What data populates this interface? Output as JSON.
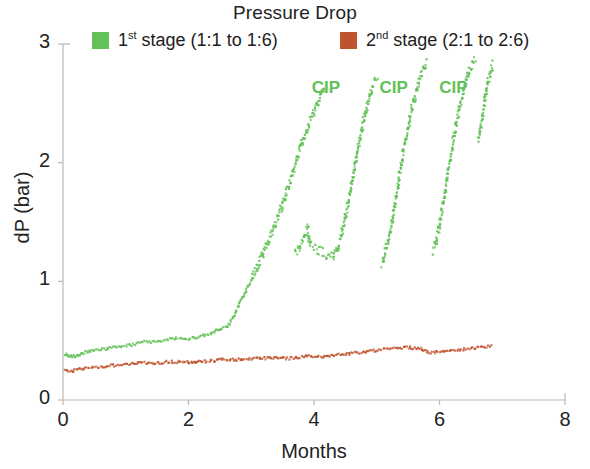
{
  "chart_data": {
    "type": "scatter",
    "title": "Pressure Drop",
    "xlabel": "Months",
    "ylabel": "dP (bar)",
    "xlim": [
      0,
      8
    ],
    "ylim": [
      0,
      3
    ],
    "xticks": [
      0,
      2,
      4,
      6,
      8
    ],
    "yticks": [
      0,
      1,
      2,
      3
    ],
    "xtick_labels": [
      "0",
      "2",
      "4",
      "6",
      "8"
    ],
    "ytick_labels": [
      "0",
      "1",
      "2",
      "3"
    ],
    "grid": false,
    "legend_position": "top",
    "colors": {
      "stage1": "#63c157",
      "stage2": "#c0522d",
      "axis": "#b8b8b8",
      "text": "#232323"
    },
    "annotations": [
      {
        "text": "CIP",
        "x": 4.22,
        "y": 2.62
      },
      {
        "text": "CIP",
        "x": 5.3,
        "y": 2.62
      },
      {
        "text": "CIP",
        "x": 6.25,
        "y": 2.62
      }
    ],
    "series": [
      {
        "name": "1st stage (1:1 to 1:6)",
        "name_parts": {
          "ordinal": "1",
          "sup": "st",
          "rest": " stage (1:1 to 1:6)"
        },
        "color": "#63c157",
        "marker": "square",
        "points": [
          [
            0.03,
            0.385
          ],
          [
            0.06,
            0.378
          ],
          [
            0.09,
            0.372
          ],
          [
            0.12,
            0.368
          ],
          [
            0.15,
            0.366
          ],
          [
            0.18,
            0.368
          ],
          [
            0.21,
            0.373
          ],
          [
            0.24,
            0.379
          ],
          [
            0.27,
            0.386
          ],
          [
            0.3,
            0.392
          ],
          [
            0.34,
            0.399
          ],
          [
            0.38,
            0.404
          ],
          [
            0.42,
            0.409
          ],
          [
            0.46,
            0.413
          ],
          [
            0.5,
            0.417
          ],
          [
            0.55,
            0.421
          ],
          [
            0.6,
            0.424
          ],
          [
            0.65,
            0.428
          ],
          [
            0.7,
            0.432
          ],
          [
            0.75,
            0.436
          ],
          [
            0.8,
            0.44
          ],
          [
            0.85,
            0.443
          ],
          [
            0.9,
            0.447
          ],
          [
            0.95,
            0.451
          ],
          [
            1.0,
            0.455
          ],
          [
            1.05,
            0.46
          ],
          [
            1.1,
            0.466
          ],
          [
            1.15,
            0.472
          ],
          [
            1.2,
            0.478
          ],
          [
            1.25,
            0.484
          ],
          [
            1.3,
            0.488
          ],
          [
            1.35,
            0.49
          ],
          [
            1.4,
            0.489
          ],
          [
            1.45,
            0.487
          ],
          [
            1.5,
            0.488
          ],
          [
            1.55,
            0.493
          ],
          [
            1.6,
            0.5
          ],
          [
            1.65,
            0.508
          ],
          [
            1.7,
            0.515
          ],
          [
            1.75,
            0.52
          ],
          [
            1.8,
            0.521
          ],
          [
            1.85,
            0.518
          ],
          [
            1.9,
            0.513
          ],
          [
            1.95,
            0.509
          ],
          [
            2.1,
            0.527
          ],
          [
            2.15,
            0.533
          ],
          [
            2.2,
            0.539
          ],
          [
            2.25,
            0.545
          ],
          [
            2.3,
            0.552
          ],
          [
            2.35,
            0.56
          ],
          [
            2.4,
            0.572
          ],
          [
            2.45,
            0.586
          ],
          [
            2.5,
            0.6
          ],
          [
            2.62,
            0.615
          ],
          [
            2.66,
            0.645
          ],
          [
            2.7,
            0.685
          ],
          [
            2.74,
            0.728
          ],
          [
            2.78,
            0.772
          ],
          [
            2.82,
            0.818
          ],
          [
            2.86,
            0.862
          ],
          [
            2.9,
            0.905
          ],
          [
            2.94,
            0.948
          ],
          [
            2.98,
            0.992
          ],
          [
            3.02,
            1.038
          ],
          [
            3.06,
            1.085
          ],
          [
            3.1,
            1.132
          ],
          [
            3.14,
            1.18
          ],
          [
            3.18,
            1.228
          ],
          [
            3.22,
            1.276
          ],
          [
            3.26,
            1.325
          ],
          [
            3.3,
            1.375
          ],
          [
            3.34,
            1.428
          ],
          [
            3.38,
            1.482
          ],
          [
            3.42,
            1.538
          ],
          [
            3.46,
            1.595
          ],
          [
            3.5,
            1.655
          ],
          [
            3.54,
            1.718
          ],
          [
            3.58,
            1.782
          ],
          [
            3.62,
            1.848
          ],
          [
            3.66,
            1.915
          ],
          [
            3.7,
            1.982
          ],
          [
            3.74,
            2.048
          ],
          [
            3.78,
            2.112
          ],
          [
            3.82,
            2.175
          ],
          [
            3.86,
            2.235
          ],
          [
            3.9,
            2.292
          ],
          [
            3.94,
            2.348
          ],
          [
            3.98,
            2.402
          ],
          [
            4.02,
            2.455
          ],
          [
            4.06,
            2.508
          ],
          [
            4.1,
            2.56
          ],
          [
            4.14,
            2.61
          ],
          [
            4.18,
            2.655
          ],
          [
            3.7,
            1.25
          ],
          [
            3.74,
            1.27
          ],
          [
            3.78,
            1.3
          ],
          [
            3.82,
            1.34
          ],
          [
            3.86,
            1.39
          ],
          [
            3.9,
            1.445
          ],
          [
            3.94,
            1.3
          ],
          [
            4.3,
            1.2
          ],
          [
            4.34,
            1.235
          ],
          [
            4.38,
            1.29
          ],
          [
            4.42,
            1.36
          ],
          [
            4.46,
            1.445
          ],
          [
            4.5,
            1.54
          ],
          [
            4.54,
            1.645
          ],
          [
            4.58,
            1.755
          ],
          [
            4.62,
            1.87
          ],
          [
            4.66,
            1.99
          ],
          [
            4.7,
            2.11
          ],
          [
            4.74,
            2.225
          ],
          [
            4.78,
            2.33
          ],
          [
            4.82,
            2.425
          ],
          [
            4.86,
            2.51
          ],
          [
            4.9,
            2.585
          ],
          [
            4.94,
            2.645
          ],
          [
            4.98,
            2.69
          ],
          [
            5.02,
            2.72
          ],
          [
            5.08,
            1.15
          ],
          [
            5.12,
            1.21
          ],
          [
            5.16,
            1.29
          ],
          [
            5.2,
            1.385
          ],
          [
            5.24,
            1.495
          ],
          [
            5.28,
            1.618
          ],
          [
            5.32,
            1.748
          ],
          [
            5.36,
            1.88
          ],
          [
            5.4,
            2.008
          ],
          [
            5.44,
            2.13
          ],
          [
            5.48,
            2.245
          ],
          [
            5.52,
            2.352
          ],
          [
            5.56,
            2.45
          ],
          [
            5.6,
            2.54
          ],
          [
            5.64,
            2.622
          ],
          [
            5.68,
            2.695
          ],
          [
            5.72,
            2.76
          ],
          [
            5.76,
            2.815
          ],
          [
            5.8,
            2.86
          ],
          [
            5.9,
            1.26
          ],
          [
            5.94,
            1.33
          ],
          [
            5.98,
            1.42
          ],
          [
            6.02,
            1.53
          ],
          [
            6.06,
            1.655
          ],
          [
            6.1,
            1.79
          ],
          [
            6.14,
            1.928
          ],
          [
            6.18,
            2.062
          ],
          [
            6.22,
            2.19
          ],
          [
            6.26,
            2.31
          ],
          [
            6.3,
            2.42
          ],
          [
            6.34,
            2.52
          ],
          [
            6.38,
            2.608
          ],
          [
            6.42,
            2.685
          ],
          [
            6.46,
            2.75
          ],
          [
            6.5,
            2.805
          ],
          [
            6.54,
            2.848
          ],
          [
            6.58,
            2.88
          ],
          [
            6.62,
            2.2
          ],
          [
            6.66,
            2.32
          ],
          [
            6.7,
            2.45
          ],
          [
            6.74,
            2.58
          ],
          [
            6.78,
            2.69
          ],
          [
            6.82,
            2.775
          ],
          [
            6.86,
            2.84
          ]
        ]
      },
      {
        "name": "2nd stage (2:1 to 2:6)",
        "name_parts": {
          "ordinal": "2",
          "sup": "nd",
          "rest": " stage (2:1 to 2:6)"
        },
        "color": "#c0522d",
        "marker": "square",
        "points": [
          [
            0.03,
            0.258
          ],
          [
            0.07,
            0.252
          ],
          [
            0.11,
            0.248
          ],
          [
            0.15,
            0.246
          ],
          [
            0.19,
            0.248
          ],
          [
            0.23,
            0.252
          ],
          [
            0.27,
            0.257
          ],
          [
            0.31,
            0.262
          ],
          [
            0.35,
            0.266
          ],
          [
            0.4,
            0.27
          ],
          [
            0.45,
            0.273
          ],
          [
            0.5,
            0.276
          ],
          [
            0.55,
            0.279
          ],
          [
            0.6,
            0.281
          ],
          [
            0.65,
            0.284
          ],
          [
            0.7,
            0.286
          ],
          [
            0.75,
            0.289
          ],
          [
            0.8,
            0.291
          ],
          [
            0.85,
            0.294
          ],
          [
            0.9,
            0.296
          ],
          [
            0.95,
            0.299
          ],
          [
            1.0,
            0.301
          ],
          [
            1.05,
            0.304
          ],
          [
            1.1,
            0.307
          ],
          [
            1.15,
            0.31
          ],
          [
            1.2,
            0.312
          ],
          [
            1.25,
            0.314
          ],
          [
            1.3,
            0.315
          ],
          [
            1.35,
            0.314
          ],
          [
            1.4,
            0.312
          ],
          [
            1.45,
            0.311
          ],
          [
            1.5,
            0.312
          ],
          [
            1.55,
            0.314
          ],
          [
            1.6,
            0.316
          ],
          [
            1.65,
            0.319
          ],
          [
            1.7,
            0.321
          ],
          [
            1.75,
            0.322
          ],
          [
            1.8,
            0.322
          ],
          [
            1.85,
            0.32
          ],
          [
            1.9,
            0.318
          ],
          [
            1.95,
            0.317
          ],
          [
            2.1,
            0.318
          ],
          [
            2.15,
            0.32
          ],
          [
            2.2,
            0.322
          ],
          [
            2.25,
            0.324
          ],
          [
            2.3,
            0.326
          ],
          [
            2.35,
            0.329
          ],
          [
            2.4,
            0.332
          ],
          [
            2.45,
            0.335
          ],
          [
            2.5,
            0.338
          ],
          [
            2.55,
            0.34
          ],
          [
            2.6,
            0.341
          ],
          [
            2.65,
            0.341
          ],
          [
            2.7,
            0.34
          ],
          [
            2.75,
            0.34
          ],
          [
            2.8,
            0.341
          ],
          [
            2.85,
            0.343
          ],
          [
            2.9,
            0.345
          ],
          [
            2.95,
            0.347
          ],
          [
            3.0,
            0.348
          ],
          [
            3.05,
            0.349
          ],
          [
            3.1,
            0.35
          ],
          [
            3.15,
            0.351
          ],
          [
            3.2,
            0.352
          ],
          [
            3.25,
            0.353
          ],
          [
            3.3,
            0.354
          ],
          [
            3.35,
            0.354
          ],
          [
            3.55,
            0.348
          ],
          [
            3.6,
            0.35
          ],
          [
            3.65,
            0.353
          ],
          [
            3.7,
            0.356
          ],
          [
            3.75,
            0.359
          ],
          [
            3.8,
            0.362
          ],
          [
            3.85,
            0.365
          ],
          [
            3.9,
            0.368
          ],
          [
            4.05,
            0.362
          ],
          [
            4.1,
            0.364
          ],
          [
            4.15,
            0.366
          ],
          [
            4.2,
            0.369
          ],
          [
            4.25,
            0.372
          ],
          [
            4.3,
            0.375
          ],
          [
            4.35,
            0.378
          ],
          [
            4.4,
            0.381
          ],
          [
            4.45,
            0.384
          ],
          [
            4.5,
            0.387
          ],
          [
            4.55,
            0.39
          ],
          [
            4.6,
            0.393
          ],
          [
            4.65,
            0.396
          ],
          [
            4.7,
            0.399
          ],
          [
            4.75,
            0.402
          ],
          [
            4.8,
            0.405
          ],
          [
            4.85,
            0.408
          ],
          [
            4.9,
            0.412
          ],
          [
            4.95,
            0.415
          ],
          [
            5.0,
            0.418
          ],
          [
            5.05,
            0.421
          ],
          [
            5.1,
            0.424
          ],
          [
            5.15,
            0.427
          ],
          [
            5.2,
            0.43
          ],
          [
            5.25,
            0.433
          ],
          [
            5.3,
            0.436
          ],
          [
            5.35,
            0.438
          ],
          [
            5.4,
            0.44
          ],
          [
            5.45,
            0.441
          ],
          [
            5.5,
            0.441
          ],
          [
            5.55,
            0.439
          ],
          [
            5.6,
            0.437
          ],
          [
            5.65,
            0.434
          ],
          [
            5.7,
            0.431
          ],
          [
            5.85,
            0.398
          ],
          [
            5.9,
            0.4
          ],
          [
            5.95,
            0.403
          ],
          [
            6.0,
            0.406
          ],
          [
            6.05,
            0.409
          ],
          [
            6.1,
            0.412
          ],
          [
            6.15,
            0.415
          ],
          [
            6.2,
            0.418
          ],
          [
            6.25,
            0.421
          ],
          [
            6.3,
            0.424
          ],
          [
            6.35,
            0.427
          ],
          [
            6.4,
            0.43
          ],
          [
            6.45,
            0.433
          ],
          [
            6.5,
            0.436
          ],
          [
            6.55,
            0.439
          ],
          [
            6.6,
            0.442
          ],
          [
            6.65,
            0.445
          ],
          [
            6.7,
            0.448
          ],
          [
            6.75,
            0.45
          ],
          [
            6.8,
            0.452
          ],
          [
            6.85,
            0.453
          ]
        ]
      }
    ]
  }
}
